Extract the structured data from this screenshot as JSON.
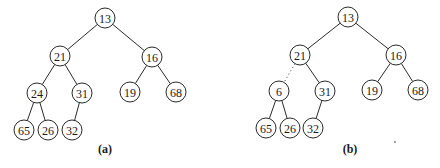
{
  "node_radius": 10,
  "colors": {
    "stroke": "#2a2a2a",
    "text": "#1a1a1a",
    "background": "#ffffff"
  },
  "trees": [
    {
      "id": "a",
      "caption": "(a)",
      "caption_pos": [
        105,
        153
      ],
      "nodes": [
        {
          "id": "a13",
          "label": "13",
          "x": 105,
          "y": 18
        },
        {
          "id": "a21",
          "label": "21",
          "x": 60,
          "y": 56
        },
        {
          "id": "a16",
          "label": "16",
          "x": 152,
          "y": 57
        },
        {
          "id": "a24",
          "label": "24",
          "x": 37,
          "y": 93
        },
        {
          "id": "a31",
          "label": "31",
          "x": 82,
          "y": 93
        },
        {
          "id": "a19",
          "label": "19",
          "x": 130,
          "y": 92
        },
        {
          "id": "a68",
          "label": "68",
          "x": 176,
          "y": 92
        },
        {
          "id": "a65",
          "label": "65",
          "x": 24,
          "y": 130
        },
        {
          "id": "a26",
          "label": "26",
          "x": 48,
          "y": 130
        },
        {
          "id": "a32",
          "label": "32",
          "x": 72,
          "y": 130
        }
      ],
      "edges": [
        {
          "from": "a13",
          "to": "a21",
          "style": "solid"
        },
        {
          "from": "a13",
          "to": "a16",
          "style": "solid"
        },
        {
          "from": "a21",
          "to": "a24",
          "style": "solid"
        },
        {
          "from": "a21",
          "to": "a31",
          "style": "solid"
        },
        {
          "from": "a16",
          "to": "a19",
          "style": "solid"
        },
        {
          "from": "a16",
          "to": "a68",
          "style": "solid"
        },
        {
          "from": "a24",
          "to": "a65",
          "style": "solid"
        },
        {
          "from": "a24",
          "to": "a26",
          "style": "solid"
        },
        {
          "from": "a31",
          "to": "a32",
          "style": "solid"
        }
      ]
    },
    {
      "id": "b",
      "caption": "(b)",
      "caption_pos": [
        350,
        153
      ],
      "nodes": [
        {
          "id": "b13",
          "label": "13",
          "x": 348,
          "y": 17
        },
        {
          "id": "b21",
          "label": "21",
          "x": 300,
          "y": 55
        },
        {
          "id": "b16",
          "label": "16",
          "x": 396,
          "y": 55
        },
        {
          "id": "b6",
          "label": "6",
          "x": 279,
          "y": 91
        },
        {
          "id": "b31",
          "label": "31",
          "x": 325,
          "y": 91
        },
        {
          "id": "b19",
          "label": "19",
          "x": 372,
          "y": 90
        },
        {
          "id": "b68",
          "label": "68",
          "x": 418,
          "y": 90
        },
        {
          "id": "b65",
          "label": "65",
          "x": 266,
          "y": 128
        },
        {
          "id": "b26",
          "label": "26",
          "x": 290,
          "y": 128
        },
        {
          "id": "b32",
          "label": "32",
          "x": 313,
          "y": 128
        }
      ],
      "edges": [
        {
          "from": "b13",
          "to": "b21",
          "style": "solid"
        },
        {
          "from": "b13",
          "to": "b16",
          "style": "solid"
        },
        {
          "from": "b21",
          "to": "b6",
          "style": "dotted"
        },
        {
          "from": "b21",
          "to": "b31",
          "style": "solid"
        },
        {
          "from": "b16",
          "to": "b19",
          "style": "solid"
        },
        {
          "from": "b16",
          "to": "b68",
          "style": "solid"
        },
        {
          "from": "b6",
          "to": "b65",
          "style": "solid"
        },
        {
          "from": "b6",
          "to": "b26",
          "style": "solid"
        },
        {
          "from": "b31",
          "to": "b32",
          "style": "solid"
        }
      ]
    }
  ]
}
